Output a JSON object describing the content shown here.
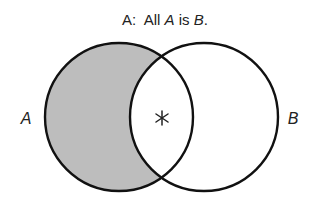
{
  "title": {
    "prefix": "A:  All ",
    "term1": "A",
    "middle": " is ",
    "term2": "B",
    "suffix": "."
  },
  "circles": [
    {
      "label": "A",
      "shaded_region": "A minus B"
    },
    {
      "label": "B"
    }
  ],
  "marker": {
    "symbol": "*",
    "region": "A and B"
  },
  "colors": {
    "stroke": "#111111",
    "shade": "#bdbdbd",
    "background": "#ffffff"
  }
}
